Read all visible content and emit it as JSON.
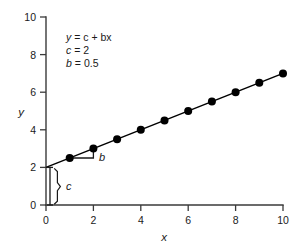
{
  "chart_data": {
    "type": "scatter",
    "title": "",
    "xlabel": "x",
    "ylabel": "y",
    "xlim": [
      0,
      10
    ],
    "ylim": [
      0,
      10
    ],
    "grid": false,
    "legend": null,
    "x": [
      1,
      2,
      3,
      4,
      5,
      6,
      7,
      8,
      9,
      10
    ],
    "values": [
      2.5,
      3,
      3.5,
      4,
      4.5,
      5,
      5.5,
      6,
      6.5,
      7
    ],
    "series": [
      {
        "name": "y = c + bx",
        "x": [
          1,
          2,
          3,
          4,
          5,
          6,
          7,
          8,
          9,
          10
        ],
        "values": [
          2.5,
          3,
          3.5,
          4,
          4.5,
          5,
          5.5,
          6,
          6.5,
          7
        ]
      }
    ],
    "fit_line": {
      "intercept": 2,
      "slope": 0.5,
      "x_start": 0,
      "y_start": 2,
      "x_end": 10,
      "y_end": 7
    },
    "x_ticks": [
      "0",
      "2",
      "4",
      "6",
      "8",
      "10"
    ],
    "x_tick_values": [
      0,
      2,
      4,
      6,
      8,
      10
    ],
    "y_ticks": [
      "0",
      "2",
      "4",
      "6",
      "8",
      "10"
    ],
    "y_tick_values": [
      0,
      2,
      4,
      6,
      8,
      10
    ],
    "annotations": {
      "equation_var_y": "y",
      "equation_rest": " = c + bx",
      "line1": "y = c + bx",
      "line2": "c = 2",
      "line3": "b = 0.5",
      "slope_label": "b",
      "intercept_label": "c"
    }
  },
  "axes": {
    "x_label": "x",
    "y_label": "y"
  },
  "equation_block": {
    "eq_y": "y",
    "eq_tail": "= c + bx",
    "c_name": "c",
    "c_value": "= 2",
    "b_name": "b",
    "b_value": "= 0.5"
  },
  "markers": {
    "slope_bracket_label": "b",
    "intercept_bracket_label": "c"
  }
}
